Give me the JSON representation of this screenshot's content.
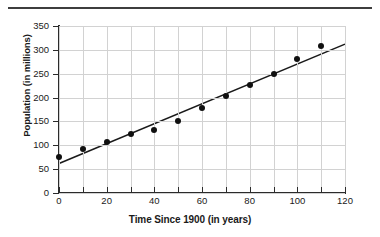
{
  "figure": {
    "top_rule": "horizontal-rule"
  },
  "chart_data": {
    "type": "scatter",
    "title": "",
    "xlabel": "Time Since 1900 (in years)",
    "ylabel": "Population (in millions)",
    "xlim": [
      0,
      120
    ],
    "ylim": [
      0,
      350
    ],
    "grid": true,
    "legend": "none",
    "x_ticks": [
      0,
      20,
      40,
      60,
      80,
      100,
      120
    ],
    "x_tick_labels": [
      "0",
      "20",
      "40",
      "60",
      "80",
      "100",
      "120"
    ],
    "x_minor_ticks": [
      10,
      30,
      50,
      70,
      90,
      110
    ],
    "y_ticks": [
      0,
      50,
      100,
      150,
      200,
      250,
      300,
      350
    ],
    "y_tick_labels": [
      "0",
      "50",
      "100",
      "150",
      "200",
      "250",
      "300",
      "350"
    ],
    "x": [
      0,
      10,
      20,
      30,
      40,
      50,
      60,
      70,
      80,
      90,
      100,
      110
    ],
    "values": [
      76,
      92,
      106,
      123,
      132,
      151,
      179,
      203,
      227,
      249,
      281,
      309
    ],
    "series": [
      {
        "name": "Population",
        "marker": "filled-circle",
        "color": "#101010",
        "x": [
          0,
          10,
          20,
          30,
          40,
          50,
          60,
          70,
          80,
          90,
          100,
          110
        ],
        "values": [
          76,
          92,
          106,
          123,
          132,
          151,
          179,
          203,
          227,
          249,
          281,
          309
        ]
      },
      {
        "name": "Line of best fit",
        "type": "line",
        "color": "#1a1a1a",
        "x": [
          0,
          120
        ],
        "values": [
          62,
          312
        ]
      }
    ],
    "annotations": []
  }
}
